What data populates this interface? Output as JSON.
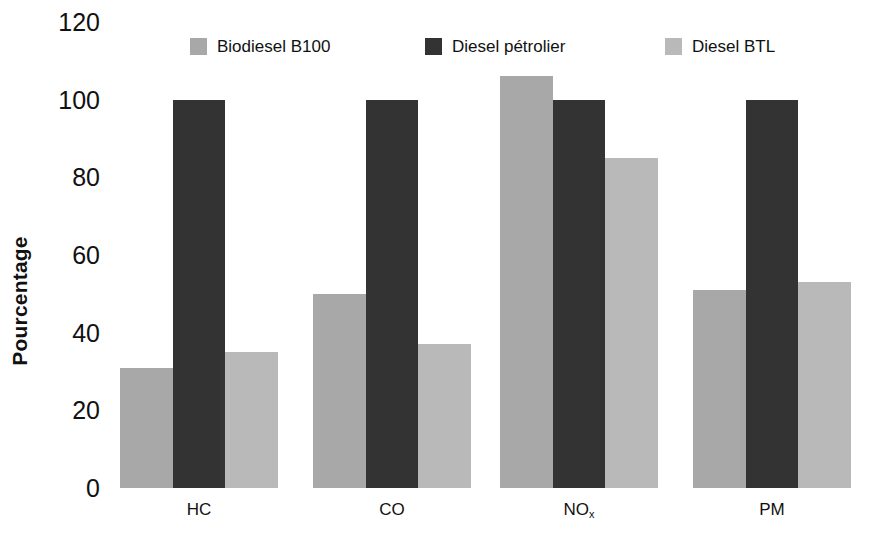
{
  "chart_data": {
    "type": "bar",
    "title": "",
    "subtitle": "",
    "xlabel": "",
    "ylabel": "Pourcentage",
    "ylim": [
      0,
      120
    ],
    "yticks": [
      0,
      20,
      40,
      60,
      80,
      100,
      120
    ],
    "ytick_labels": [
      "0",
      "20",
      "40",
      "60",
      "80",
      "100",
      "120"
    ],
    "grid": false,
    "legend_position": "top",
    "categories": [
      "HC",
      "CO",
      "NOx",
      "PM"
    ],
    "category_labels": [
      {
        "text": "HC",
        "sub": ""
      },
      {
        "text": "CO",
        "sub": ""
      },
      {
        "text": "NO",
        "sub": "x"
      },
      {
        "text": "PM",
        "sub": ""
      }
    ],
    "series": [
      {
        "name": "Biodiesel B100",
        "color": "#a8a8a8",
        "values": [
          31,
          50,
          106,
          51
        ]
      },
      {
        "name": "Diesel pétrolier",
        "color": "#333333",
        "values": [
          100,
          100,
          100,
          100
        ]
      },
      {
        "name": "Diesel BTL",
        "color": "#b9b9b9",
        "values": [
          35,
          37,
          85,
          53
        ]
      }
    ]
  },
  "legend": {
    "items": [
      {
        "label": "Biodiesel B100",
        "color": "#a8a8a8"
      },
      {
        "label": "Diesel pétrolier",
        "color": "#333333"
      },
      {
        "label": "Diesel BTL",
        "color": "#b9b9b9"
      }
    ]
  },
  "axis": {
    "y_title": "Pourcentage"
  },
  "colors": {
    "background": "#ffffff",
    "text": "#111111",
    "series_biodiesel": "#a8a8a8",
    "series_diesel": "#333333",
    "series_btl": "#b9b9b9"
  }
}
